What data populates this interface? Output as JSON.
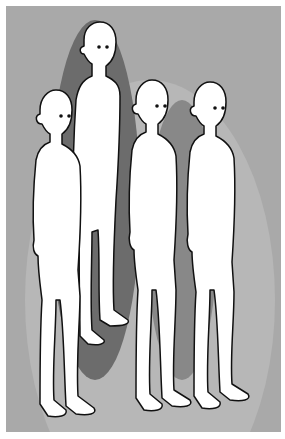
{
  "illustration": {
    "description": "Four bald white human figures standing in a group, viewed three-quarter from the side, against gray background with overlapping darker oval shapes",
    "figure_count": 4,
    "colors": {
      "border": "#ffffff",
      "background": "#a9a9a9",
      "oval_light": "#b9b9b9",
      "oval_dark": "#6c6c6c",
      "oval_mid": "#8a8a8a",
      "figure_fill": "#ffffff",
      "outline": "#111111"
    },
    "figures": [
      {
        "id": "left-short",
        "cx": 55,
        "head_y": 110
      },
      {
        "id": "tall-back",
        "cx": 95,
        "head_y": 45
      },
      {
        "id": "middle",
        "cx": 152,
        "head_y": 100
      },
      {
        "id": "right",
        "cx": 210,
        "head_y": 102
      }
    ]
  }
}
